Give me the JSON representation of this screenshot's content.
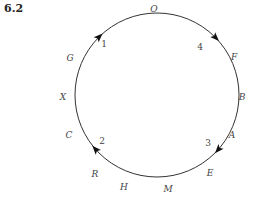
{
  "figure_number": "6.2",
  "circle": {
    "cx": 157,
    "cy": 95,
    "r": 82,
    "color": "#333333"
  },
  "outer_labels": [
    {
      "text": "O",
      "x": 154,
      "y": 12
    },
    {
      "text": "F",
      "x": 234,
      "y": 60
    },
    {
      "text": "B",
      "x": 242,
      "y": 100
    },
    {
      "text": "A",
      "x": 232,
      "y": 138
    },
    {
      "text": "E",
      "x": 210,
      "y": 176
    },
    {
      "text": "M",
      "x": 168,
      "y": 192
    },
    {
      "text": "H",
      "x": 124,
      "y": 190
    },
    {
      "text": "R",
      "x": 95,
      "y": 177
    },
    {
      "text": "C",
      "x": 69,
      "y": 138
    },
    {
      "text": "X",
      "x": 63,
      "y": 100
    },
    {
      "text": "G",
      "x": 70,
      "y": 61
    }
  ],
  "inner_labels": [
    {
      "text": "1",
      "x": 104,
      "y": 47
    },
    {
      "text": "4",
      "x": 200,
      "y": 50
    },
    {
      "text": "2",
      "x": 102,
      "y": 144
    },
    {
      "text": "3",
      "x": 208,
      "y": 146
    }
  ],
  "arrows": [
    {
      "id": "arrow-1",
      "x": 98,
      "y": 36,
      "angle": 225
    },
    {
      "id": "arrow-4",
      "x": 216,
      "y": 37,
      "angle": 135
    },
    {
      "id": "arrow-2",
      "x": 95,
      "y": 150,
      "angle": 225
    },
    {
      "id": "arrow-3",
      "x": 219,
      "y": 150,
      "angle": 315
    }
  ]
}
